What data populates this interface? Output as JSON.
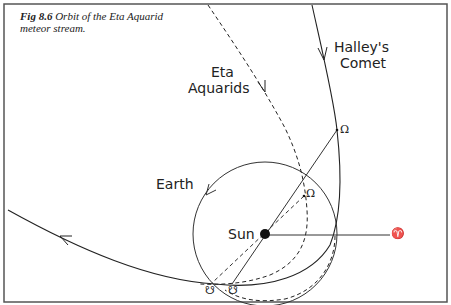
{
  "figure": {
    "number": "Fig 8.6",
    "title": "Orbit of the Eta Aquarid meteor stream."
  },
  "labels": {
    "halley_line1": "Halley's",
    "halley_line2": "Comet",
    "eta_line1": "Eta",
    "eta_line2": "Aquarids",
    "earth": "Earth",
    "sun": "Sun"
  },
  "symbols": {
    "ascending_node_comet": "Ω",
    "ascending_node_stream": "Ω",
    "descending_node_stream": "☋",
    "descending_node_comet": "☋",
    "vernal_equinox": "♈"
  },
  "colors": {
    "ink": "#222222",
    "frame": "#555555",
    "background": "#ffffff"
  }
}
